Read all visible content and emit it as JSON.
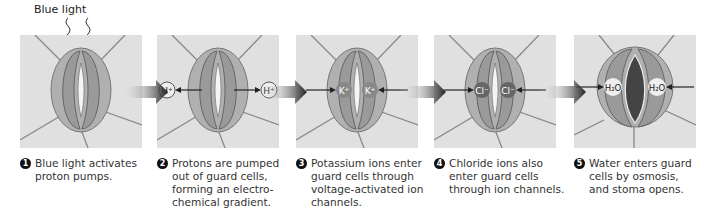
{
  "title": "Blue light",
  "panels": [
    {
      "step": "1",
      "caption": "Blue light activates\nproton pumps.",
      "ion": "",
      "direction": "none",
      "open": false
    },
    {
      "step": "2",
      "caption": "Protons are pumped\nout of guard cells,\nforming an electro-\nchemical gradient.",
      "ion": "H+",
      "direction": "out",
      "open": false
    },
    {
      "step": "3",
      "caption": "Potassium ions enter\nguard cells through\nvoltage-activated ion\nchannels.",
      "ion": "K+",
      "direction": "in",
      "open": false
    },
    {
      "step": "4",
      "caption": "Chloride ions also\nenter guard cells\nthrough ion channels.",
      "ion": "Cl−",
      "direction": "in",
      "open": false
    },
    {
      "step": "5",
      "caption": "Water enters guard\ncells by osmosis,\nand stoma opens.",
      "ion": "H2O",
      "direction": "in",
      "open": true
    }
  ],
  "colors": {
    "panel_bg": "#e0e0e0",
    "cell": "#a8a8a8",
    "cell_line": "#777777",
    "arrow": "#222222"
  }
}
